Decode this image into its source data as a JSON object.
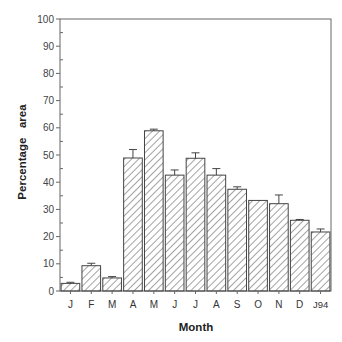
{
  "chart_data": {
    "type": "bar",
    "title": "",
    "xlabel": "Month",
    "ylabel": "Percentage   area",
    "ylim": [
      0,
      100
    ],
    "yticks": [
      0,
      10,
      20,
      30,
      40,
      50,
      60,
      70,
      80,
      90,
      100
    ],
    "grid": false,
    "legend": null,
    "categories": [
      "J",
      "F",
      "M",
      "A",
      "M",
      "J",
      "J",
      "A",
      "S",
      "O",
      "N",
      "D",
      "J 94"
    ],
    "values": [
      2.8,
      9.3,
      4.8,
      48.9,
      58.9,
      42.6,
      48.8,
      42.6,
      37.4,
      33.3,
      32.1,
      26.0,
      21.7
    ],
    "error_upper": [
      3.2,
      10.2,
      5.3,
      52.0,
      59.5,
      44.5,
      50.8,
      45.0,
      38.3,
      33.3,
      35.3,
      26.3,
      22.8
    ],
    "bar_fill": "diagonal-hatch",
    "bar_color": "#333333"
  }
}
